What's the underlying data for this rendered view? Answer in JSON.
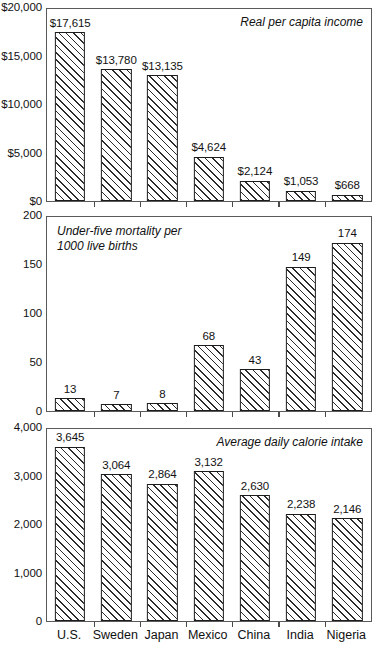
{
  "chart_data": [
    {
      "type": "bar",
      "title": "Real per capita income",
      "title_align": "right",
      "xlabel": "",
      "ylabel": "",
      "ylim": [
        0,
        20000
      ],
      "grid": false,
      "legend": "none",
      "categories": [
        "U.S.",
        "Sweden",
        "Japan",
        "Mexico",
        "China",
        "India",
        "Nigeria"
      ],
      "values": [
        17615,
        13780,
        13135,
        4624,
        2124,
        1053,
        668
      ],
      "value_labels": [
        "$17,615",
        "$13,780",
        "$13,135",
        "$4,624",
        "$2,124",
        "$1,053",
        "$668"
      ],
      "yticks": [
        0,
        5000,
        10000,
        15000,
        20000
      ],
      "ytick_labels": [
        "$0",
        "$5,000",
        "$10,000",
        "$15,000",
        "$20,000"
      ]
    },
    {
      "type": "bar",
      "title": "Under-five mortality per\n1000 live births",
      "title_align": "left",
      "xlabel": "",
      "ylabel": "",
      "ylim": [
        0,
        200
      ],
      "grid": false,
      "legend": "none",
      "categories": [
        "U.S.",
        "Sweden",
        "Japan",
        "Mexico",
        "China",
        "India",
        "Nigeria"
      ],
      "values": [
        13,
        7,
        8,
        68,
        43,
        149,
        174
      ],
      "value_labels": [
        "13",
        "7",
        "8",
        "68",
        "43",
        "149",
        "174"
      ],
      "yticks": [
        0,
        50,
        100,
        150,
        200
      ],
      "ytick_labels": [
        "0",
        "50",
        "100",
        "150",
        "200"
      ]
    },
    {
      "type": "bar",
      "title": "Average daily calorie intake",
      "title_align": "right",
      "xlabel": "",
      "ylabel": "",
      "ylim": [
        0,
        4000
      ],
      "grid": false,
      "legend": "none",
      "categories": [
        "U.S.",
        "Sweden",
        "Japan",
        "Mexico",
        "China",
        "India",
        "Nigeria"
      ],
      "values": [
        3645,
        3064,
        2864,
        3132,
        2630,
        2238,
        2146
      ],
      "value_labels": [
        "3,645",
        "3,064",
        "2,864",
        "3,132",
        "2,630",
        "2,238",
        "2,146"
      ],
      "yticks": [
        0,
        1000,
        2000,
        3000,
        4000
      ],
      "ytick_labels": [
        "0",
        "1,000",
        "2,000",
        "3,000",
        "4,000"
      ]
    }
  ],
  "colors": {
    "bar_border": "#1c1c1c",
    "bar_hatch": "#2b2b2b",
    "frame": "#5a5a5a",
    "text": "#111111",
    "background": "#ffffff"
  },
  "layout": {
    "panels": [
      {
        "top": 8,
        "plot_height": 194,
        "xaxis_visible": false
      },
      {
        "top": 216,
        "plot_height": 196,
        "xaxis_visible": false
      },
      {
        "top": 428,
        "plot_height": 194,
        "xaxis_visible": true
      }
    ]
  }
}
